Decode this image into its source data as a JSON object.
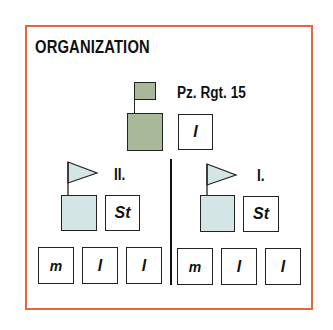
{
  "title": "ORGANIZATION",
  "colors": {
    "border": "#e8643a",
    "hq": "#a9b898",
    "battalion": "#d3e5e5"
  },
  "regiment": {
    "label": "Pz. Rgt. 15",
    "staff_box": "l"
  },
  "battalions": [
    {
      "label": "II.",
      "staff_box": "St",
      "companies": [
        "m",
        "l",
        "l"
      ]
    },
    {
      "label": "I.",
      "staff_box": "St",
      "companies": [
        "m",
        "l",
        "l"
      ]
    }
  ]
}
